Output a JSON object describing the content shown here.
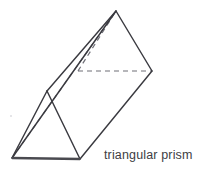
{
  "figure": {
    "name": "triangular prism",
    "caption": "triangular prism",
    "background_color": "#ffffff",
    "stroke_color": "#3a3a40",
    "hidden_stroke_color": "#6f6f77",
    "base_stroke_color": "#4a4a50",
    "caption_color": "#3d3d43",
    "width": 199,
    "height": 177
  },
  "geometry": {
    "description": "Oblique view of a triangular prism tilted so the near triangular face rests at lower-left and the far triangular face points to upper-right.",
    "vertices": {
      "near_bottom_left": [
        12,
        158
      ],
      "near_bottom_right": [
        80,
        159
      ],
      "near_apex": [
        47,
        91
      ],
      "far_apex": [
        116,
        11
      ],
      "far_right": [
        152,
        71
      ],
      "far_hidden": [
        78,
        71
      ]
    },
    "visible_edges": [
      {
        "name": "near-face-base",
        "from": "near_bottom_left",
        "to": "near_bottom_right"
      },
      {
        "name": "near-face-left",
        "from": "near_bottom_left",
        "to": "near_apex"
      },
      {
        "name": "near-face-right",
        "from": "near_apex",
        "to": "near_bottom_right"
      },
      {
        "name": "far-face-left",
        "from": "far_hidden",
        "to": "far_apex"
      },
      {
        "name": "far-face-right",
        "from": "far_apex",
        "to": "far_right"
      },
      {
        "name": "lateral-top",
        "from": "near_apex",
        "to": "far_apex"
      },
      {
        "name": "lateral-left",
        "from": "near_bottom_left",
        "to": "far_apex"
      },
      {
        "name": "lateral-bottom-right",
        "from": "near_bottom_right",
        "to": "far_right"
      }
    ],
    "hidden_edges": [
      {
        "name": "far-face-base-hidden",
        "from": "far_hidden",
        "to": "far_right",
        "style": "dashed"
      },
      {
        "name": "lateral-hidden",
        "from": "near_bottom_left",
        "to": "far_hidden",
        "style": "dashed"
      }
    ],
    "face_count": 5,
    "vertex_count": 6,
    "edge_count": 9
  }
}
